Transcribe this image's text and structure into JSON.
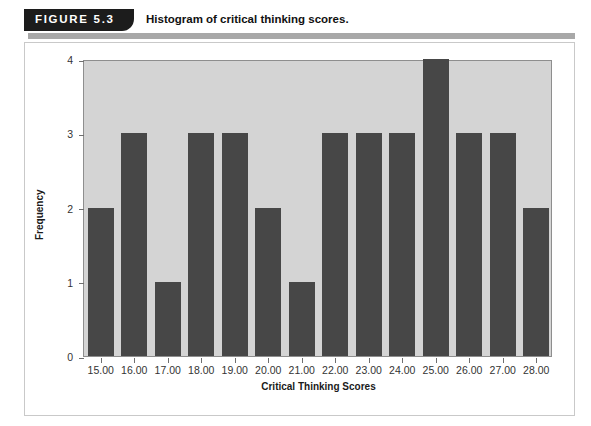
{
  "figure": {
    "badge_label": "FIGURE 5.3",
    "title": "Histogram of critical thinking scores."
  },
  "colors": {
    "badge_background": "#1c1c1c",
    "badge_text": "#ffffff",
    "header_rule": "#a8a8a8",
    "plot_background": "#d4d4d4",
    "plot_border": "#8e8e8e",
    "bar_fill": "#474747",
    "frame_border": "#c9c9c9",
    "axis_text": "#333333"
  },
  "chart_data": {
    "type": "bar",
    "title": "Histogram of critical thinking scores.",
    "xlabel": "Critical Thinking Scores",
    "ylabel": "Frequency",
    "categories": [
      "15.00",
      "16.00",
      "17.00",
      "18.00",
      "19.00",
      "20.00",
      "21.00",
      "22.00",
      "23.00",
      "24.00",
      "25.00",
      "26.00",
      "27.00",
      "28.00"
    ],
    "values": [
      2,
      3,
      1,
      3,
      3,
      2,
      1,
      3,
      3,
      3,
      4,
      3,
      3,
      2
    ],
    "ylim": [
      0,
      4
    ],
    "ytick_labels": [
      "0",
      "1",
      "2",
      "3",
      "4"
    ],
    "ytick_values": [
      0,
      1,
      2,
      3,
      4
    ],
    "grid": false,
    "legend": null
  }
}
